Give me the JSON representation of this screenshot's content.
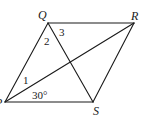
{
  "diagram": {
    "type": "geometry",
    "shape": "rhombus",
    "vertices": {
      "P": {
        "label": "P",
        "x": 5,
        "y": 102
      },
      "Q": {
        "label": "Q",
        "x": 48,
        "y": 23
      },
      "R": {
        "label": "R",
        "x": 134,
        "y": 23
      },
      "S": {
        "label": "S",
        "x": 93,
        "y": 102
      }
    },
    "edges": [
      [
        "P",
        "Q"
      ],
      [
        "Q",
        "R"
      ],
      [
        "R",
        "S"
      ],
      [
        "S",
        "P"
      ]
    ],
    "diagonals": [
      [
        "P",
        "R"
      ],
      [
        "Q",
        "S"
      ]
    ],
    "angle_labels": {
      "angle1": "1",
      "angle2": "2",
      "angle3": "3",
      "angle_given": "30°"
    },
    "colors": {
      "stroke": "#1a1a1a",
      "background": "#ffffff"
    }
  }
}
